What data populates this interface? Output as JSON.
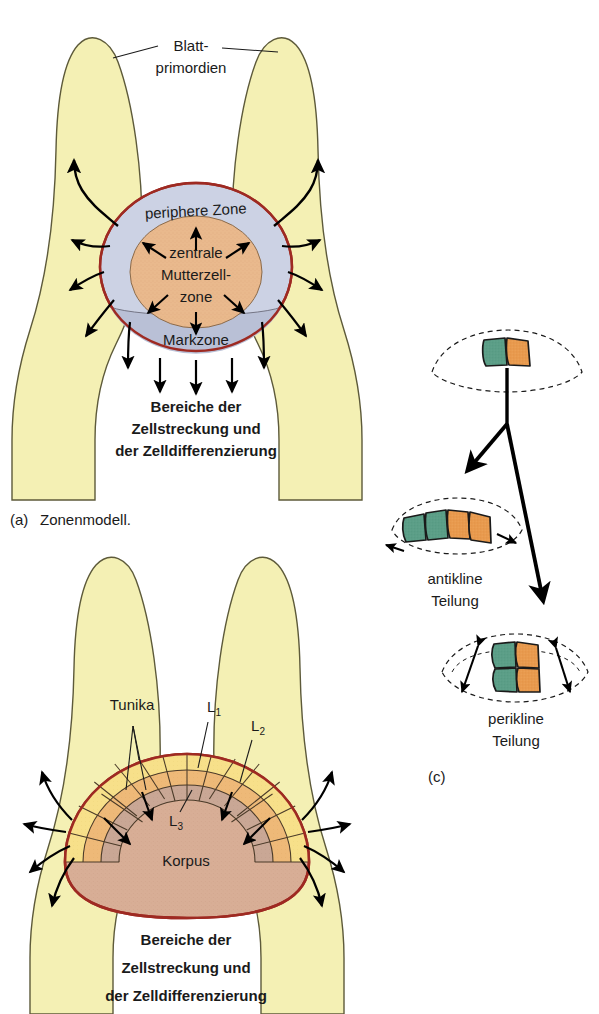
{
  "figure": {
    "panels": [
      {
        "key": "a",
        "caption_marker": "(a)",
        "caption_text": "Zonenmodell."
      },
      {
        "key": "b",
        "caption_marker": "",
        "caption_text": ""
      },
      {
        "key": "c",
        "caption_marker": "(c)",
        "caption_text": ""
      }
    ]
  },
  "panel_a": {
    "leaf_primordia_label_line1": "Blatt-",
    "leaf_primordia_label_line2": "primordien",
    "peripheral_zone": "periphere Zone",
    "central_zone_line1": "zentrale",
    "central_zone_line2": "Mutterzell-",
    "central_zone_line3": "zone",
    "pith_zone": "Markzone",
    "elongation_line1": "Bereiche der",
    "elongation_line2": "Zellstreckung und",
    "elongation_line3": "der Zelldifferenzierung",
    "caption_marker": "(a)",
    "caption_text": "Zonenmodell."
  },
  "panel_b": {
    "tunica_label": "Tunika",
    "layer_l1": "L",
    "layer_l1_sub": "1",
    "layer_l2": "L",
    "layer_l2_sub": "2",
    "layer_l3": "L",
    "layer_l3_sub": "3",
    "corpus_label": "Korpus",
    "elongation_line1": "Bereiche der",
    "elongation_line2": "Zellstreckung und",
    "elongation_line3": "der Zelldifferenzierung"
  },
  "panel_c": {
    "anticline_line1": "antikline",
    "anticline_line2": "Teilung",
    "pericline_line1": "perikline",
    "pericline_line2": "Teilung",
    "caption_marker": "(c)",
    "cells_initial": [
      "green",
      "orange"
    ],
    "cells_anticline": [
      "green",
      "green",
      "orange",
      "orange"
    ],
    "cells_pericline": [
      "green",
      "orange",
      "green",
      "orange"
    ]
  },
  "colors": {
    "leaf_primordium_fill": "#f4f0b4",
    "leaf_primordium_stroke": "#5d5a3a",
    "meristem_outline": "#9e2a22",
    "peripheral_zone_fill": "#ccd2e4",
    "pith_zone_fill": "#b9c0d6",
    "central_zone_fill": "#eab98c",
    "tunica_l1_fill": "#f7e08a",
    "tunica_l2_fill": "#eeb978",
    "tunica_l3_fill": "#c9a795",
    "corpus_fill": "#d8ae96",
    "cell_green": "#5b9e87",
    "cell_orange": "#e89a4e",
    "cell_stroke": "#1a1a1a",
    "arrow_black": "#000000",
    "text": "#1a1a1a",
    "background": "#ffffff"
  }
}
